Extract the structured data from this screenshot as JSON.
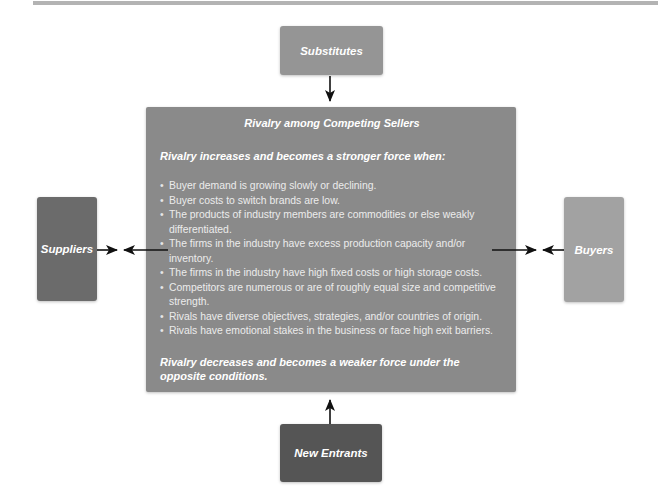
{
  "diagram": {
    "title": "Rivalry among Competing Sellers",
    "intro": "Rivalry increases and becomes a stronger force when:",
    "conditions": [
      "Buyer demand is growing slowly or declining.",
      "Buyer costs to switch brands are low.",
      "The products of industry members are commodities or else weakly differentiated.",
      "The firms in the industry have excess production capacity and/or inventory.",
      "The firms in the industry have high fixed costs or high storage costs.",
      "Competitors are numerous or are of roughly equal size and competitive strength.",
      "Rivals have diverse objectives, strategies, and/or countries of origin.",
      "Rivals have emotional stakes in the business or face high exit barriers."
    ],
    "conclusion": "Rivalry decreases and becomes a weaker force under the opposite conditions.",
    "forces": {
      "top": "Substitutes",
      "bottom": "New Entrants",
      "left": "Suppliers",
      "right": "Buyers"
    },
    "colors": {
      "substitutes": "#959595",
      "new_entrants": "#555555",
      "suppliers": "#6b6b6b",
      "buyers": "#a2a2a2",
      "center": "#8a8a8a",
      "arrow": "#111111"
    }
  }
}
